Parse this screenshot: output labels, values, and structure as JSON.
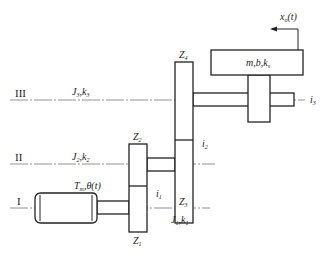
{
  "diagram": {
    "type": "gear-transmission-schematic",
    "shafts": [
      {
        "id": "I",
        "roman": "I",
        "inertia_stiffness": {
          "J": "J",
          "J_sub": "1",
          "k": "k",
          "k_sub": "1"
        }
      },
      {
        "id": "II",
        "roman": "II",
        "inertia_stiffness": {
          "J": "J",
          "J_sub": "2",
          "k": "k",
          "k_sub": "2"
        }
      },
      {
        "id": "III",
        "roman": "III",
        "inertia_stiffness": {
          "J": "J",
          "J_sub": "3",
          "k": "k",
          "k_sub": "3"
        }
      }
    ],
    "gears": [
      {
        "id": "Z1",
        "label": "Z",
        "sub": "1"
      },
      {
        "id": "Z2",
        "label": "Z",
        "sub": "2"
      },
      {
        "id": "Z3",
        "label": "Z",
        "sub": "3"
      },
      {
        "id": "Z4",
        "label": "Z",
        "sub": "4"
      }
    ],
    "ratios": [
      {
        "id": "i1",
        "label": "i",
        "sub": "1"
      },
      {
        "id": "i2",
        "label": "i",
        "sub": "2"
      },
      {
        "id": "i3",
        "label": "i",
        "sub": "3"
      }
    ],
    "motor": {
      "torque": "T",
      "torque_sub": "m",
      "angle": "θ(t)",
      "separator": ","
    },
    "load": {
      "m": "m",
      "b": "b",
      "k": "k",
      "k_sub": "s",
      "sep": ","
    },
    "output": {
      "x": "x",
      "x_sub": "o",
      "arg": "(t)"
    }
  }
}
